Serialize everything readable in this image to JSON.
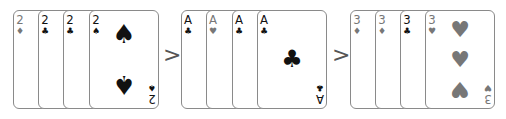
{
  "comparator": ">",
  "colors": {
    "black_suit": "#111111",
    "gray_suit": "#777777",
    "card_border": "#8a8a8a"
  },
  "groups": [
    {
      "cards": [
        {
          "rank": "2",
          "suit": "♦",
          "suit_name": "diamonds"
        },
        {
          "rank": "2",
          "suit": "♣",
          "suit_name": "clubs"
        },
        {
          "rank": "2",
          "suit": "♣",
          "suit_name": "clubs"
        },
        {
          "rank": "2",
          "suit": "♠",
          "suit_name": "spades"
        }
      ]
    },
    {
      "cards": [
        {
          "rank": "A",
          "suit": "♣",
          "suit_name": "clubs"
        },
        {
          "rank": "A",
          "suit": "♥",
          "suit_name": "hearts"
        },
        {
          "rank": "A",
          "suit": "♣",
          "suit_name": "clubs"
        },
        {
          "rank": "A",
          "suit": "♣",
          "suit_name": "clubs"
        }
      ]
    },
    {
      "cards": [
        {
          "rank": "3",
          "suit": "♦",
          "suit_name": "diamonds"
        },
        {
          "rank": "3",
          "suit": "♦",
          "suit_name": "diamonds"
        },
        {
          "rank": "3",
          "suit": "♣",
          "suit_name": "clubs"
        },
        {
          "rank": "3",
          "suit": "♥",
          "suit_name": "hearts"
        }
      ]
    }
  ]
}
